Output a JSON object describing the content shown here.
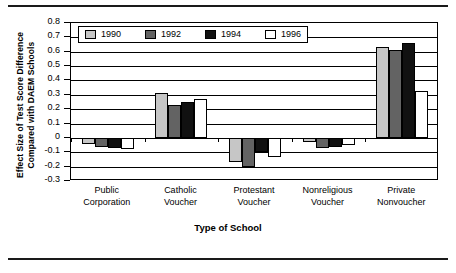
{
  "chart_data": {
    "type": "bar",
    "title": "",
    "xlabel": "Type of School",
    "ylabel": "Effect Size of Test Score Difference Compared with DAEM Schools",
    "ylabel_line1": "Effect Size of Test Score Difference",
    "ylabel_line2": "Compared with DAEM Schools",
    "categories": [
      "Public Corporation",
      "Catholic Voucher",
      "Protestant Voucher",
      "Nonreligious Voucher",
      "Private Nonvoucher"
    ],
    "category_lines": [
      [
        "Public",
        "Corporation"
      ],
      [
        "Catholic",
        "Voucher"
      ],
      [
        "Protestant",
        "Voucher"
      ],
      [
        "Nonreligious",
        "Voucher"
      ],
      [
        "Private",
        "Nonvoucher"
      ]
    ],
    "series": [
      {
        "name": "1990",
        "color": "#c6c6c6",
        "values": [
          -0.04,
          0.31,
          -0.17,
          -0.03,
          0.63
        ]
      },
      {
        "name": "1992",
        "color": "#636363",
        "values": [
          -0.06,
          0.23,
          -0.2,
          -0.07,
          0.61
        ]
      },
      {
        "name": "1994",
        "color": "#111111",
        "values": [
          -0.07,
          0.25,
          -0.1,
          -0.06,
          0.66
        ]
      },
      {
        "name": "1996",
        "color": "#ffffff",
        "values": [
          -0.08,
          0.27,
          -0.13,
          -0.05,
          0.33
        ]
      }
    ],
    "ylim": [
      -0.3,
      0.8
    ],
    "ytick_labels": [
      "0.8",
      "0.7",
      "0.6",
      "0.5",
      "0.4",
      "0.3",
      "0.2",
      "0.1",
      "0",
      "-0.1",
      "-0.2",
      "-0.3"
    ],
    "ytick_values": [
      0.8,
      0.7,
      0.6,
      0.5,
      0.4,
      0.3,
      0.2,
      0.1,
      0,
      -0.1,
      -0.2,
      -0.3
    ],
    "grid": true,
    "legend_position": "top-left-inside",
    "legend_entries": [
      "1990",
      "1992",
      "1994",
      "1996"
    ]
  }
}
